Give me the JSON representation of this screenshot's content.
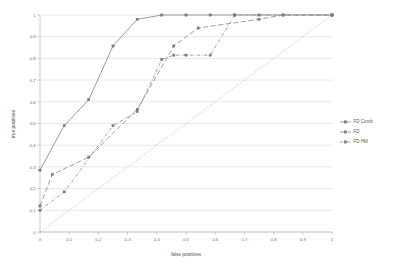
{
  "chart_data": {
    "type": "line",
    "title": "",
    "xlabel": "false positives",
    "ylabel": "true positives",
    "xlim": [
      0,
      1
    ],
    "ylim": [
      0,
      1
    ],
    "grid": "horizontal",
    "legend_position": "right",
    "x_tick_labels": [
      "0",
      "0,1",
      "0,2",
      "0,3",
      "0,4",
      "0,5",
      "0,6",
      "0,7",
      "0,8",
      "0,9",
      "1"
    ],
    "y_tick_labels": [
      "0",
      "0,1",
      "0,2",
      "0,3",
      "0,4",
      "0,5",
      "0,6",
      "0,7",
      "0,8",
      "0,9",
      "1"
    ],
    "x_ticks": [
      0,
      0.1,
      0.2,
      0.3,
      0.4,
      0.5,
      0.6,
      0.7,
      0.8,
      0.9,
      1
    ],
    "y_ticks": [
      0,
      0.1,
      0.2,
      0.3,
      0.4,
      0.5,
      0.6,
      0.7,
      0.8,
      0.9,
      1
    ],
    "series": [
      {
        "name": "FD Comb",
        "line_style": "solid",
        "marker": "square",
        "color": "#8a8a8a",
        "points": [
          [
            0,
            0.285
          ],
          [
            0.083,
            0.49
          ],
          [
            0.167,
            0.61
          ],
          [
            0.25,
            0.857
          ],
          [
            0.333,
            0.98
          ],
          [
            0.417,
            1
          ],
          [
            0.5,
            1
          ],
          [
            0.583,
            1
          ],
          [
            0.667,
            1
          ],
          [
            0.75,
            1
          ],
          [
            0.833,
            1
          ],
          [
            1,
            1
          ]
        ]
      },
      {
        "name": "FD",
        "line_style": "dashed",
        "marker": "square",
        "color": "#8a8a8a",
        "points": [
          [
            0,
            0.12
          ],
          [
            0.042,
            0.265
          ],
          [
            0.167,
            0.345
          ],
          [
            0.333,
            0.565
          ],
          [
            0.458,
            0.857
          ],
          [
            0.542,
            0.94
          ],
          [
            0.75,
            0.98
          ],
          [
            0.833,
            1
          ],
          [
            1,
            1
          ]
        ]
      },
      {
        "name": "FD HM",
        "line_style": "dash-dot",
        "marker": "square",
        "color": "#8a8a8a",
        "points": [
          [
            0,
            0.1
          ],
          [
            0.083,
            0.185
          ],
          [
            0.25,
            0.49
          ],
          [
            0.333,
            0.555
          ],
          [
            0.417,
            0.795
          ],
          [
            0.458,
            0.815
          ],
          [
            0.5,
            0.815
          ],
          [
            0.583,
            0.815
          ],
          [
            0.667,
            1
          ],
          [
            1,
            1
          ]
        ]
      }
    ],
    "reference_line": {
      "name": "diagonal",
      "line_style": "dotted",
      "color": "#9a9a9a",
      "points": [
        [
          0,
          0
        ],
        [
          1,
          1
        ]
      ]
    }
  },
  "legend": {
    "entries": [
      {
        "label": "FD Comb"
      },
      {
        "label": "FD"
      },
      {
        "label": "FD HM"
      }
    ]
  }
}
